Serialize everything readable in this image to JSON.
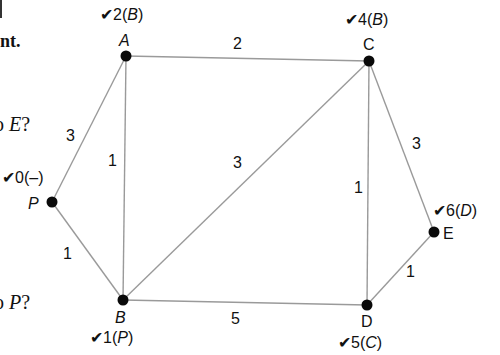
{
  "margin_text": {
    "top_fragment": "nt.",
    "question_e_prefix": "o ",
    "question_e_var": "E",
    "question_e_suffix": "?",
    "question_p_prefix": "o ",
    "question_p_var": "P",
    "question_p_suffix": "?"
  },
  "graph": {
    "nodes": [
      {
        "id": "A",
        "label": "A",
        "italic": true,
        "x": 126,
        "y": 56,
        "mark": {
          "check": "✔",
          "dist": "2",
          "pred": "B"
        }
      },
      {
        "id": "C",
        "label": "C",
        "italic": false,
        "x": 369,
        "y": 61,
        "mark": {
          "check": "✔",
          "dist": "4",
          "pred": "B"
        }
      },
      {
        "id": "P",
        "label": "P",
        "italic": true,
        "x": 52,
        "y": 202,
        "mark": {
          "check": "✔",
          "dist": "0",
          "pred": "–"
        }
      },
      {
        "id": "B",
        "label": "B",
        "italic": true,
        "x": 123,
        "y": 300,
        "mark": {
          "check": "✔",
          "dist": "1",
          "pred": "P"
        }
      },
      {
        "id": "D",
        "label": "D",
        "italic": false,
        "x": 367,
        "y": 305,
        "mark": {
          "check": "✔",
          "dist": "5",
          "pred": "C"
        }
      },
      {
        "id": "E",
        "label": "E",
        "italic": false,
        "x": 434,
        "y": 232,
        "mark": {
          "check": "✔",
          "dist": "6",
          "pred": "D"
        }
      }
    ],
    "edges": [
      {
        "from": "A",
        "to": "C",
        "weight": "2"
      },
      {
        "from": "P",
        "to": "A",
        "weight": "3"
      },
      {
        "from": "A",
        "to": "B",
        "weight": "1"
      },
      {
        "from": "P",
        "to": "B",
        "weight": "1"
      },
      {
        "from": "B",
        "to": "C",
        "weight": "3"
      },
      {
        "from": "B",
        "to": "D",
        "weight": "5"
      },
      {
        "from": "C",
        "to": "D",
        "weight": "1"
      },
      {
        "from": "C",
        "to": "E",
        "weight": "3"
      },
      {
        "from": "D",
        "to": "E",
        "weight": "1"
      }
    ]
  },
  "colors": {
    "edge": "#9a9a9a",
    "node": "#0a0a0a",
    "text": "#111111"
  }
}
